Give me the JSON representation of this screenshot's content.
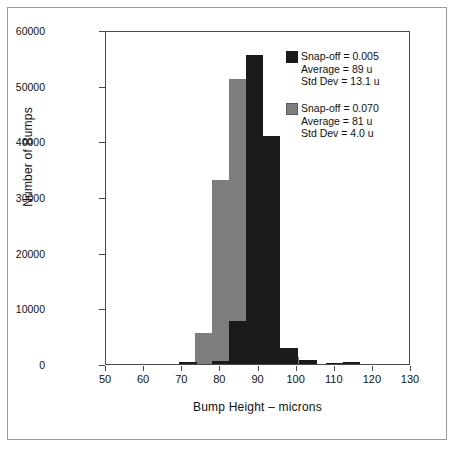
{
  "chart_data": {
    "type": "bar",
    "title": "",
    "subtitle": "",
    "xlabel": "Bump Height – microns",
    "ylabel": "Number of Bumps",
    "xlim": [
      50,
      130
    ],
    "ylim": [
      0,
      60000
    ],
    "grid": false,
    "legend_position": "top-right",
    "bin_width": 4.5,
    "xticks": [
      50,
      60,
      70,
      80,
      90,
      100,
      110,
      120,
      130
    ],
    "yticks": [
      0,
      10000,
      20000,
      30000,
      40000,
      50000,
      60000
    ],
    "xtick_labels": [
      "50",
      "60",
      "70",
      "80",
      "90",
      "100",
      "110",
      "120",
      "130"
    ],
    "ytick_labels": [
      "0",
      "10000",
      "20000",
      "30000",
      "40000",
      "50000",
      "60000"
    ],
    "series": [
      {
        "name": "Snap-off = 0.005",
        "color": "#1a1a1a",
        "x": [
          71.5,
          80.0,
          84.5,
          89.0,
          93.5,
          98.0,
          103.0,
          110.0,
          114.5
        ],
        "values": [
          300,
          600,
          7800,
          55500,
          41000,
          2800,
          700,
          250,
          300
        ]
      },
      {
        "name": "Snap-off = 0.070",
        "color": "#7d7d7d",
        "x": [
          75.5,
          80.0,
          84.5,
          89.0,
          93.5,
          98.5
        ],
        "values": [
          5500,
          33000,
          51200,
          400,
          17600,
          1300
        ]
      }
    ],
    "annotations": []
  },
  "legend": {
    "entries": [
      {
        "swatch": "#1a1a1a",
        "title": "Snap-off = 0.005",
        "lines": [
          "Average = 89 u",
          "Std Dev = 13.1 u"
        ]
      },
      {
        "swatch": "#7d7d7d",
        "title": "Snap-off = 0.070",
        "lines": [
          "Average = 81 u",
          "Std Dev = 4.0 u"
        ]
      }
    ]
  },
  "colors": {
    "series_dark": "#1a1a1a",
    "series_gray": "#7d7d7d",
    "axis": "#4a4a4a",
    "border": "#9a9a9a",
    "background": "#ffffff"
  }
}
